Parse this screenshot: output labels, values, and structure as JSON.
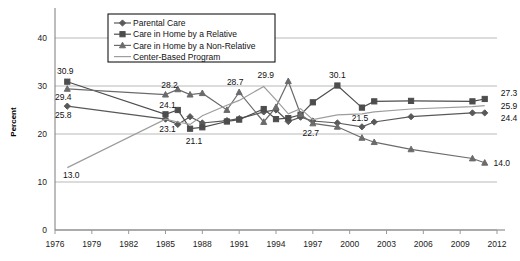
{
  "chart_data": {
    "type": "line",
    "title": "",
    "xlabel": "",
    "ylabel": "Percent",
    "xlim": [
      1976,
      2012
    ],
    "ylim": [
      0,
      45
    ],
    "yticks": [
      0,
      10,
      20,
      30,
      40
    ],
    "xticks": [
      1976,
      1979,
      1982,
      1985,
      1988,
      1991,
      1994,
      1997,
      2000,
      2003,
      2006,
      2009,
      2012
    ],
    "grid": true,
    "legend_position": "top-center",
    "x": [
      1977,
      1985,
      1986,
      1987,
      1988,
      1990,
      1991,
      1993,
      1994,
      1995,
      1996,
      1997,
      1999,
      2001,
      2002,
      2005,
      2010,
      2011
    ],
    "series": [
      {
        "name": "Parental Care",
        "marker": "diamond",
        "color": "#595959",
        "values": [
          25.8,
          23.1,
          22.0,
          23.6,
          22.3,
          22.8,
          23.2,
          24.6,
          25.0,
          22.6,
          23.5,
          22.7,
          22.3,
          21.5,
          22.5,
          23.6,
          24.4,
          24.4
        ]
      },
      {
        "name": "Care in Home by a Relative",
        "marker": "square",
        "color": "#4d4d4d",
        "values": [
          30.9,
          24.1,
          25.0,
          21.1,
          21.4,
          22.6,
          23.0,
          25.2,
          23.1,
          23.3,
          24.0,
          26.6,
          30.1,
          25.5,
          26.8,
          26.9,
          26.8,
          27.3
        ]
      },
      {
        "name": "Care in Home by a Non-Relative",
        "marker": "triangle",
        "color": "#6b6b6b",
        "values": [
          29.4,
          28.2,
          29.3,
          28.2,
          28.5,
          25.0,
          28.7,
          22.5,
          25.6,
          31.0,
          24.1,
          22.2,
          21.5,
          19.2,
          18.3,
          16.8,
          14.9,
          14.0
        ]
      },
      {
        "name": "Center-Based Program",
        "marker": "none",
        "color": "#9d9d9d",
        "values": [
          13.0,
          23.1,
          22.5,
          22.0,
          23.8,
          26.0,
          27.0,
          29.9,
          27.1,
          24.2,
          25.3,
          23.0,
          24.0,
          24.2,
          24.6,
          25.2,
          25.7,
          25.9
        ]
      }
    ],
    "annotations": [
      {
        "text": "30.9",
        "x": 1977,
        "y": 30.9,
        "dx": -2,
        "dy": -8,
        "anchor": "middle"
      },
      {
        "text": "29.4",
        "x": 1977,
        "y": 29.4,
        "dx": -4,
        "dy": 11,
        "anchor": "middle"
      },
      {
        "text": "25.8",
        "x": 1977,
        "y": 25.8,
        "dx": -4,
        "dy": 12,
        "anchor": "middle"
      },
      {
        "text": "13.0",
        "x": 1977,
        "y": 13.0,
        "dx": 4,
        "dy": 10,
        "anchor": "middle"
      },
      {
        "text": "28.2",
        "x": 1985,
        "y": 28.2,
        "dx": 4,
        "dy": -7,
        "anchor": "middle"
      },
      {
        "text": "24.1",
        "x": 1985,
        "y": 24.1,
        "dx": 2,
        "dy": -6,
        "anchor": "middle"
      },
      {
        "text": "23.1",
        "x": 1985,
        "y": 23.1,
        "dx": 2,
        "dy": 13,
        "anchor": "middle"
      },
      {
        "text": "21.1",
        "x": 1987,
        "y": 21.1,
        "dx": 4,
        "dy": 15,
        "anchor": "middle"
      },
      {
        "text": "28.7",
        "x": 1991,
        "y": 28.7,
        "dx": -4,
        "dy": -7,
        "anchor": "middle"
      },
      {
        "text": "29.9",
        "x": 1993,
        "y": 29.9,
        "dx": 2,
        "dy": -8,
        "anchor": "middle"
      },
      {
        "text": "22.7",
        "x": 1997,
        "y": 22.7,
        "dx": -2,
        "dy": 15,
        "anchor": "middle"
      },
      {
        "text": "30.1",
        "x": 1999,
        "y": 30.1,
        "dx": 0,
        "dy": -8,
        "anchor": "middle"
      },
      {
        "text": "21.5",
        "x": 2001,
        "y": 21.5,
        "dx": -2,
        "dy": -6,
        "anchor": "middle"
      },
      {
        "text": "14.0",
        "x": 2011,
        "y": 14.0,
        "dx": 17,
        "dy": 3,
        "anchor": "middle"
      },
      {
        "text": "27.3",
        "x": 2011,
        "y": 27.3,
        "dx": 16,
        "dy": -3,
        "anchor": "start"
      },
      {
        "text": "25.9",
        "x": 2011,
        "y": 25.9,
        "dx": 16,
        "dy": 3,
        "anchor": "start"
      },
      {
        "text": "24.4",
        "x": 2011,
        "y": 24.4,
        "dx": 16,
        "dy": 8,
        "anchor": "start"
      }
    ]
  }
}
